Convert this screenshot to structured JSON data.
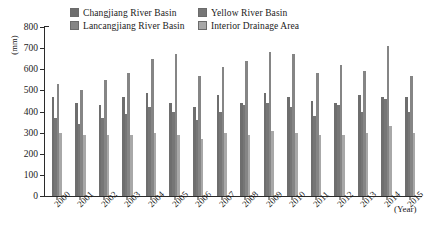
{
  "legend": {
    "items": [
      {
        "label": "Changjiang River Basin",
        "color": "#6e6e6e",
        "key": "changjiang"
      },
      {
        "label": "Yellow River Basin",
        "color": "#767676",
        "key": "yellow"
      },
      {
        "label": "Lancangjiang River Basin",
        "color": "#858585",
        "key": "lancangjiang"
      },
      {
        "label": "Interior Drainage Area",
        "color": "#a8a8a8",
        "key": "interior"
      }
    ]
  },
  "axes": {
    "y_title": "(mm)",
    "x_title": "(Year)",
    "y_ticks": [
      "0",
      "100",
      "200",
      "300",
      "400",
      "500",
      "600",
      "700",
      "800"
    ],
    "x_ticks": [
      "2000",
      "2001",
      "2002",
      "2003",
      "2004",
      "2005",
      "2006",
      "2007",
      "2008",
      "2009",
      "2010",
      "2011",
      "2012",
      "2013",
      "2014",
      "2015"
    ]
  },
  "chart_data": {
    "type": "bar",
    "title": "",
    "xlabel": "(Year)",
    "ylabel": "(mm)",
    "ylim": [
      0,
      800
    ],
    "ytick_step": 100,
    "grid": false,
    "legend_position": "top-center",
    "categories": [
      "2000",
      "2001",
      "2002",
      "2003",
      "2004",
      "2005",
      "2006",
      "2007",
      "2008",
      "2009",
      "2010",
      "2011",
      "2012",
      "2013",
      "2014",
      "2015"
    ],
    "series": [
      {
        "name": "Changjiang River Basin",
        "color": "#6e6e6e",
        "values": [
          470,
          440,
          430,
          470,
          490,
          440,
          420,
          480,
          440,
          490,
          470,
          450,
          440,
          480,
          470,
          470
        ]
      },
      {
        "name": "Yellow River Basin",
        "color": "#767676",
        "values": [
          370,
          340,
          370,
          390,
          420,
          400,
          360,
          400,
          430,
          440,
          420,
          380,
          430,
          400,
          460,
          400
        ]
      },
      {
        "name": "Lancangjiang River Basin",
        "color": "#858585",
        "values": [
          530,
          500,
          550,
          580,
          650,
          670,
          570,
          610,
          640,
          680,
          670,
          580,
          620,
          590,
          710,
          570
        ]
      },
      {
        "name": "Interior Drainage Area",
        "color": "#a8a8a8",
        "values": [
          300,
          290,
          290,
          290,
          300,
          290,
          270,
          300,
          290,
          310,
          300,
          290,
          290,
          300,
          330,
          300
        ]
      }
    ]
  }
}
